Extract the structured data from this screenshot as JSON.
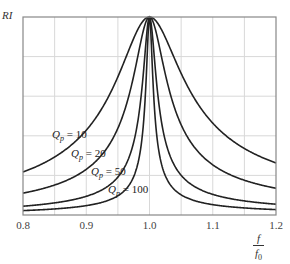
{
  "chart_data": {
    "type": "line",
    "title": "",
    "xlabel": "f / f0",
    "xlabel_num": "f",
    "xlabel_den": "f",
    "xlabel_den_sub": "0",
    "ylabel": "RI",
    "xlim": [
      0.8,
      1.2
    ],
    "ylim": [
      0,
      1
    ],
    "grid": true,
    "x_ticks": [
      "0.8",
      "0.9",
      "1.0",
      "1.1",
      "1.2"
    ],
    "x_grid_step": 0.05,
    "y_grid_lines": 5,
    "legend": "inline labels",
    "series": [
      {
        "name": "Qp = 10",
        "Q": 10,
        "label_prefix": "Q",
        "label_sub": "p",
        "label_value": "10",
        "x": [
          0.8,
          0.85,
          0.9,
          0.95,
          1.0,
          1.05,
          1.1,
          1.15,
          1.2
        ],
        "values": [
          0.22,
          0.3,
          0.43,
          0.69,
          1.0,
          0.72,
          0.48,
          0.35,
          0.27
        ]
      },
      {
        "name": "Qp = 20",
        "Q": 20,
        "label_prefix": "Q",
        "label_sub": "p",
        "label_value": "20",
        "x": [
          0.8,
          0.85,
          0.9,
          0.95,
          1.0,
          1.05,
          1.1,
          1.15,
          1.2
        ],
        "values": [
          0.11,
          0.15,
          0.23,
          0.43,
          1.0,
          0.46,
          0.26,
          0.18,
          0.14
        ]
      },
      {
        "name": "Qp = 50",
        "Q": 50,
        "label_prefix": "Q",
        "label_sub": "p",
        "label_value": "50",
        "x": [
          0.8,
          0.85,
          0.9,
          0.95,
          1.0,
          1.05,
          1.1,
          1.15,
          1.2
        ],
        "values": [
          0.044,
          0.06,
          0.095,
          0.19,
          1.0,
          0.2,
          0.11,
          0.075,
          0.055
        ]
      },
      {
        "name": "Qp = 100",
        "Q": 100,
        "label_prefix": "Q",
        "label_sub": "p",
        "label_value": "100",
        "x": [
          0.8,
          0.85,
          0.9,
          0.95,
          1.0,
          1.05,
          1.1,
          1.15,
          1.2
        ],
        "values": [
          0.022,
          0.03,
          0.047,
          0.097,
          1.0,
          0.1,
          0.052,
          0.037,
          0.027
        ]
      }
    ],
    "formula_note": "RI = 1 / sqrt(1 + Qp^2 (f/f0 - f0/f)^2)"
  },
  "colors": {
    "curve": "#222222",
    "grid": "#d8d8d8",
    "frame": "#888888",
    "text": "#333333"
  },
  "layout": {
    "plot_left": 23,
    "plot_top": 17,
    "plot_right": 276,
    "plot_bottom": 215
  },
  "label_positions": [
    {
      "left": 52,
      "top": 128
    },
    {
      "left": 71,
      "top": 147
    },
    {
      "left": 91,
      "top": 165
    },
    {
      "left": 108,
      "top": 183
    }
  ]
}
